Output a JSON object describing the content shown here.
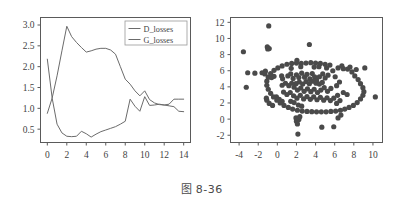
{
  "caption": {
    "prefix": "图",
    "number": "8-36",
    "full": "图 8-36"
  },
  "colors": {
    "line": "#6b6b6b",
    "axis": "#5a5a5a",
    "text": "#3f3f3f",
    "point": "#4a4a4a",
    "background": "#ffffff",
    "legend_border": "#9a9a9a"
  },
  "chart_data": [
    {
      "type": "line",
      "title": "",
      "xlabel": "",
      "ylabel": "",
      "xlim": [
        -0.7,
        14.7
      ],
      "ylim": [
        0.18,
        3.18
      ],
      "xticks": [
        0,
        2,
        4,
        6,
        8,
        10,
        12,
        14
      ],
      "yticks": [
        0.5,
        1.0,
        1.5,
        2.0,
        2.5,
        3.0
      ],
      "xtick_labels": [
        "0",
        "2",
        "4",
        "6",
        "8",
        "10",
        "12",
        "14"
      ],
      "ytick_labels": [
        "0.5",
        "1.0",
        "1.5",
        "2.0",
        "2.5",
        "3.0"
      ],
      "grid": false,
      "legend_position": "upper right",
      "legend": [
        "D_losses",
        "G_losses"
      ],
      "x": [
        0,
        0.5,
        1,
        1.5,
        2,
        2.5,
        3,
        3.5,
        4,
        4.5,
        5,
        5.5,
        6,
        6.5,
        7,
        7.5,
        8,
        8.5,
        9,
        9.5,
        10,
        10.5,
        11,
        11.5,
        12,
        12.5,
        13,
        13.5,
        14
      ],
      "series": [
        {
          "name": "D_losses",
          "values": [
            2.18,
            1.24,
            0.62,
            0.41,
            0.33,
            0.32,
            0.33,
            0.45,
            0.39,
            0.31,
            0.38,
            0.44,
            0.48,
            0.52,
            0.56,
            0.62,
            0.69,
            1.22,
            1.05,
            0.93,
            1.28,
            1.07,
            1.08,
            1.1,
            1.08,
            1.06,
            1.04,
            0.93,
            0.92
          ]
        },
        {
          "name": "G_losses",
          "values": [
            0.88,
            1.25,
            1.78,
            2.38,
            2.97,
            2.72,
            2.58,
            2.46,
            2.35,
            2.38,
            2.42,
            2.44,
            2.44,
            2.4,
            2.3,
            2.0,
            1.7,
            1.58,
            1.42,
            1.3,
            1.42,
            1.21,
            1.13,
            1.09,
            1.08,
            1.1,
            1.22,
            1.22,
            1.22
          ]
        }
      ]
    },
    {
      "type": "scatter",
      "title": "",
      "xlabel": "",
      "ylabel": "",
      "xlim": [
        -4.9,
        11.0
      ],
      "ylim": [
        -2.9,
        12.6
      ],
      "xticks": [
        -4,
        -2,
        0,
        2,
        4,
        6,
        8,
        10
      ],
      "yticks": [
        -2,
        0,
        2,
        4,
        6,
        8,
        10,
        12
      ],
      "xtick_labels": [
        "-4",
        "-2",
        "0",
        "2",
        "4",
        "6",
        "8",
        "10"
      ],
      "ytick_labels": [
        "-2",
        "0",
        "2",
        "4",
        "6",
        "8",
        "10",
        "12"
      ],
      "grid": false,
      "marker": "circle",
      "marker_size": 2.6,
      "points": [
        [
          -0.9,
          11.55
        ],
        [
          3.35,
          9.25
        ],
        [
          -1.05,
          8.95
        ],
        [
          -1.0,
          8.7
        ],
        [
          -0.85,
          8.75
        ],
        [
          -3.55,
          8.35
        ],
        [
          -3.1,
          5.75
        ],
        [
          -2.35,
          5.7
        ],
        [
          -1.6,
          5.75
        ],
        [
          -1.25,
          5.95
        ],
        [
          -1.3,
          5.6
        ],
        [
          -3.25,
          3.95
        ],
        [
          -0.6,
          5.15
        ],
        [
          -0.35,
          5.3
        ],
        [
          0.45,
          5.35
        ],
        [
          0.55,
          5.0
        ],
        [
          1.1,
          5.35
        ],
        [
          1.4,
          5.6
        ],
        [
          1.65,
          5.05
        ],
        [
          2.0,
          5.5
        ],
        [
          2.25,
          5.15
        ],
        [
          2.55,
          5.7
        ],
        [
          2.85,
          5.2
        ],
        [
          3.1,
          5.55
        ],
        [
          3.4,
          5.0
        ],
        [
          3.65,
          5.65
        ],
        [
          3.9,
          5.25
        ],
        [
          4.1,
          4.8
        ],
        [
          4.4,
          5.25
        ],
        [
          4.75,
          5.6
        ],
        [
          5.0,
          5.1
        ],
        [
          5.3,
          5.45
        ],
        [
          1.95,
          4.4
        ],
        [
          2.3,
          4.6
        ],
        [
          2.65,
          4.35
        ],
        [
          3.0,
          4.65
        ],
        [
          3.35,
          4.4
        ],
        [
          3.7,
          4.7
        ],
        [
          4.05,
          4.45
        ],
        [
          4.4,
          4.35
        ],
        [
          4.7,
          4.55
        ],
        [
          1.5,
          4.45
        ],
        [
          1.2,
          4.15
        ],
        [
          0.85,
          4.45
        ],
        [
          0.5,
          4.2
        ],
        [
          1.75,
          3.95
        ],
        [
          2.1,
          3.6
        ],
        [
          2.45,
          3.85
        ],
        [
          2.8,
          3.45
        ],
        [
          3.15,
          3.75
        ],
        [
          3.5,
          3.4
        ],
        [
          3.85,
          3.7
        ],
        [
          4.2,
          3.3
        ],
        [
          4.55,
          3.6
        ],
        [
          4.9,
          3.9
        ],
        [
          5.25,
          3.45
        ],
        [
          5.6,
          3.8
        ],
        [
          1.35,
          3.3
        ],
        [
          1.0,
          3.05
        ],
        [
          0.65,
          3.35
        ],
        [
          1.7,
          2.9
        ],
        [
          2.05,
          2.6
        ],
        [
          2.4,
          2.95
        ],
        [
          2.75,
          2.5
        ],
        [
          3.1,
          2.8
        ],
        [
          3.45,
          2.45
        ],
        [
          3.8,
          2.75
        ],
        [
          4.15,
          2.4
        ],
        [
          4.5,
          2.7
        ],
        [
          4.85,
          2.35
        ],
        [
          5.2,
          2.65
        ],
        [
          5.55,
          2.3
        ],
        [
          5.9,
          2.6
        ],
        [
          6.3,
          2.95
        ],
        [
          6.55,
          2.3
        ],
        [
          0.2,
          2.45
        ],
        [
          0.5,
          2.2
        ],
        [
          -0.1,
          2.75
        ],
        [
          6.2,
          4.15
        ],
        [
          6.5,
          4.6
        ],
        [
          6.05,
          5.25
        ],
        [
          5.8,
          6.0
        ],
        [
          6.35,
          6.35
        ],
        [
          6.9,
          6.25
        ],
        [
          7.35,
          6.2
        ],
        [
          7.8,
          5.85
        ],
        [
          8.1,
          5.35
        ],
        [
          8.45,
          4.9
        ],
        [
          8.7,
          4.4
        ],
        [
          8.95,
          3.9
        ],
        [
          9.05,
          3.4
        ],
        [
          8.95,
          2.95
        ],
        [
          8.7,
          2.5
        ],
        [
          8.35,
          2.05
        ],
        [
          7.95,
          1.7
        ],
        [
          7.5,
          1.45
        ],
        [
          7.05,
          1.25
        ],
        [
          6.6,
          1.1
        ],
        [
          6.1,
          1.0
        ],
        [
          5.6,
          0.95
        ],
        [
          5.1,
          0.9
        ],
        [
          4.6,
          0.9
        ],
        [
          4.1,
          0.9
        ],
        [
          3.6,
          0.92
        ],
        [
          3.1,
          0.95
        ],
        [
          2.6,
          1.0
        ],
        [
          2.1,
          1.1
        ],
        [
          1.6,
          1.25
        ],
        [
          1.15,
          1.45
        ],
        [
          0.7,
          1.7
        ],
        [
          0.3,
          2.0
        ],
        [
          -0.05,
          2.35
        ],
        [
          -0.4,
          2.75
        ],
        [
          -0.7,
          3.2
        ],
        [
          -0.95,
          3.7
        ],
        [
          -1.1,
          4.2
        ],
        [
          -1.1,
          4.7
        ],
        [
          -0.95,
          5.2
        ],
        [
          -0.7,
          5.65
        ],
        [
          -0.35,
          6.05
        ],
        [
          0.05,
          6.35
        ],
        [
          0.5,
          6.6
        ],
        [
          1.0,
          6.8
        ],
        [
          1.5,
          6.9
        ],
        [
          2.0,
          6.95
        ],
        [
          2.5,
          6.9
        ],
        [
          3.0,
          6.95
        ],
        [
          3.5,
          7.0
        ],
        [
          4.0,
          6.95
        ],
        [
          4.5,
          6.9
        ],
        [
          5.0,
          6.8
        ],
        [
          5.5,
          6.7
        ],
        [
          2.05,
          7.3
        ],
        [
          2.45,
          6.5
        ],
        [
          1.45,
          6.3
        ],
        [
          3.85,
          6.45
        ],
        [
          4.35,
          6.5
        ],
        [
          5.15,
          6.35
        ],
        [
          6.75,
          6.6
        ],
        [
          7.6,
          6.45
        ],
        [
          8.25,
          6.15
        ],
        [
          9.15,
          6.35
        ],
        [
          10.25,
          2.75
        ],
        [
          6.65,
          0.5
        ],
        [
          6.35,
          0.15
        ],
        [
          5.9,
          -0.95
        ],
        [
          4.65,
          -1.0
        ],
        [
          2.15,
          -1.85
        ],
        [
          2.0,
          -0.25
        ],
        [
          2.25,
          -0.05
        ],
        [
          1.95,
          0.15
        ],
        [
          2.35,
          0.3
        ],
        [
          2.1,
          -0.6
        ],
        [
          -1.1,
          2.35
        ],
        [
          -1.15,
          2.6
        ],
        [
          -0.85,
          1.95
        ],
        [
          -0.5,
          1.7
        ],
        [
          1.4,
          2.2
        ],
        [
          1.75,
          2.05
        ],
        [
          2.2,
          1.75
        ],
        [
          2.55,
          1.6
        ],
        [
          6.9,
          3.3
        ],
        [
          7.3,
          3.05
        ],
        [
          6.2,
          1.95
        ]
      ]
    }
  ]
}
